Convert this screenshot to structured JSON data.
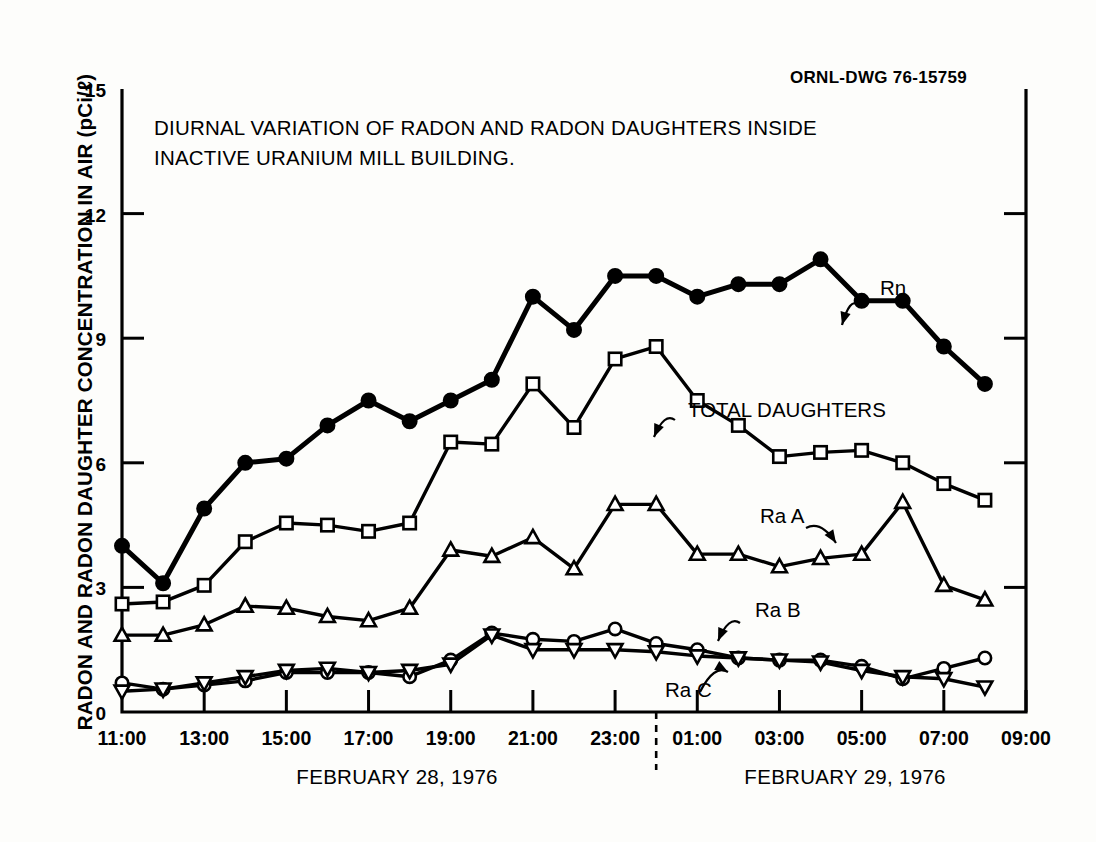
{
  "figure": {
    "drawing_number": "ORNL-DWG 76-15759",
    "title_line1": "DIURNAL VARIATION OF RADON AND RADON DAUGHTERS INSIDE",
    "title_line2": "INACTIVE URANIUM MILL BUILDING.",
    "day1_label": "FEBRUARY 28, 1976",
    "day2_label": "FEBRUARY 29, 1976",
    "ink_color": "#000000",
    "paper_color": "#fdfdfb"
  },
  "chart_data": {
    "type": "line",
    "xlabel": "",
    "ylabel": "RADON AND RADON DAUGHTER CONCENTRATION IN AIR (pCi/ℓ)",
    "ylim": [
      0,
      15
    ],
    "yticks": [
      0,
      3,
      6,
      9,
      12,
      15
    ],
    "ytick_labels": [
      "0",
      "3",
      "6",
      "9",
      "12",
      "15"
    ],
    "xlim": [
      11,
      33
    ],
    "xticks": [
      11,
      13,
      15,
      17,
      19,
      21,
      23,
      25,
      27,
      29,
      31,
      33
    ],
    "xtick_labels": [
      "11:00",
      "13:00",
      "15:00",
      "17:00",
      "19:00",
      "21:00",
      "23:00",
      "01:00",
      "03:00",
      "05:00",
      "07:00",
      "09:00"
    ],
    "grid": false,
    "legend_position": "inline-annotations",
    "midnight_divider_x": 24,
    "x": [
      11,
      12,
      13,
      14,
      15,
      16,
      17,
      18,
      19,
      20,
      21,
      22,
      23,
      24,
      25,
      26,
      27,
      28,
      29,
      30,
      31,
      32
    ],
    "series": [
      {
        "name": "Rn",
        "marker": "filled-circle",
        "values": [
          4.0,
          3.1,
          4.9,
          6.0,
          6.1,
          6.9,
          7.5,
          7.0,
          7.5,
          8.0,
          10.0,
          9.2,
          10.5,
          10.5,
          10.0,
          10.3,
          10.3,
          10.9,
          9.9,
          9.9,
          8.8,
          7.9
        ]
      },
      {
        "name": "TOTAL DAUGHTERS",
        "marker": "open-square",
        "values": [
          2.6,
          2.65,
          3.05,
          4.1,
          4.55,
          4.5,
          4.35,
          4.55,
          6.5,
          6.45,
          7.9,
          6.85,
          8.5,
          8.8,
          7.5,
          6.9,
          6.15,
          6.25,
          6.3,
          6.0,
          5.5,
          5.1
        ]
      },
      {
        "name": "Ra A",
        "marker": "open-triangle-up",
        "values": [
          1.85,
          1.85,
          2.1,
          2.55,
          2.5,
          2.3,
          2.2,
          2.5,
          3.9,
          3.75,
          4.2,
          3.45,
          5.0,
          5.0,
          3.8,
          3.8,
          3.5,
          3.7,
          3.8,
          5.05,
          3.05,
          2.7
        ]
      },
      {
        "name": "Ra B",
        "marker": "open-circle",
        "values": [
          0.7,
          0.55,
          0.65,
          0.75,
          0.95,
          0.95,
          0.95,
          0.85,
          1.25,
          1.9,
          1.75,
          1.7,
          2.0,
          1.65,
          1.5,
          1.3,
          1.25,
          1.25,
          1.1,
          0.8,
          1.05,
          1.3
        ]
      },
      {
        "name": "Ra C",
        "marker": "open-triangle-down",
        "values": [
          0.5,
          0.55,
          0.7,
          0.85,
          1.0,
          1.05,
          0.95,
          1.0,
          1.15,
          1.85,
          1.5,
          1.5,
          1.5,
          1.45,
          1.35,
          1.3,
          1.25,
          1.2,
          1.0,
          0.85,
          0.8,
          0.6
        ]
      }
    ],
    "annotations": [
      {
        "text": "Rn",
        "series": "Rn"
      },
      {
        "text": "TOTAL DAUGHTERS",
        "series": "TOTAL DAUGHTERS"
      },
      {
        "text": "Ra A",
        "series": "Ra A"
      },
      {
        "text": "Ra B",
        "series": "Ra B"
      },
      {
        "text": "Ra C",
        "series": "Ra C"
      }
    ]
  }
}
